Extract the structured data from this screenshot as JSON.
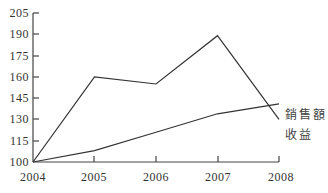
{
  "chart_data": {
    "type": "line",
    "title": "",
    "xlabel": "",
    "ylabel": "",
    "categories": [
      "2004",
      "2005",
      "2006",
      "2007",
      "2008"
    ],
    "series": [
      {
        "name": "銷售額",
        "values": [
          100,
          160,
          155,
          189,
          130
        ]
      },
      {
        "name": "收益",
        "values": [
          100,
          108,
          121,
          134,
          141
        ]
      }
    ],
    "ylim": [
      100,
      205
    ],
    "yticks": [
      100,
      115,
      130,
      145,
      160,
      175,
      190,
      205
    ],
    "grid": false,
    "legend_position": "inline-right"
  },
  "labels": {
    "yticks": [
      "100",
      "115",
      "130",
      "145",
      "160",
      "175",
      "190",
      "205"
    ],
    "xticks": [
      "2004",
      "2005",
      "2006",
      "2007",
      "2008"
    ],
    "series_sales": "銷售額",
    "series_profit": "收益"
  }
}
